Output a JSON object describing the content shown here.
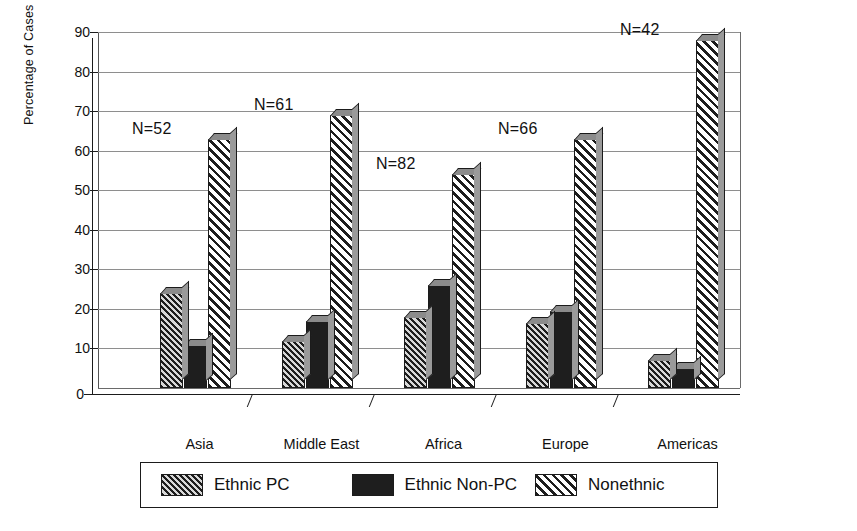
{
  "chart_data": {
    "type": "bar",
    "title": "",
    "xlabel": "",
    "ylabel": "Percentage of Cases",
    "ylim": [
      0,
      90
    ],
    "yticks": [
      0,
      10,
      20,
      30,
      40,
      50,
      60,
      70,
      80,
      90
    ],
    "grid": true,
    "legend_position": "bottom",
    "categories": [
      "Asia",
      "Middle East",
      "Africa",
      "Europe",
      "Americas"
    ],
    "series": [
      {
        "name": "Ethnic PC",
        "values": [
          24,
          12,
          18,
          16.5,
          7
        ]
      },
      {
        "name": "Ethnic Non-PC",
        "values": [
          11,
          17,
          26,
          19.5,
          5
        ]
      },
      {
        "name": "Nonethnic",
        "values": [
          63,
          69,
          54,
          63,
          88
        ]
      }
    ],
    "annotations": [
      {
        "category": "Asia",
        "text": "N=52"
      },
      {
        "category": "Middle East",
        "text": "N=61"
      },
      {
        "category": "Africa",
        "text": "N=82"
      },
      {
        "category": "Europe",
        "text": "N=66"
      },
      {
        "category": "Americas",
        "text": "N=42"
      }
    ],
    "colors": {
      "ethnic_pc": "#585858",
      "ethnic_non_pc": "#1e1e1e",
      "nonethnic": "#6d6d6d",
      "axis": "#1b1b1b",
      "grid": "#8e8e8e",
      "background": "#ffffff"
    }
  },
  "axis": {
    "y_title": "Percentage of Cases",
    "tick_labels": [
      "90",
      "80",
      "70",
      "60",
      "50",
      "40",
      "30",
      "20",
      "10",
      "0"
    ],
    "category_labels": [
      "Asia",
      "Middle East",
      "Africa",
      "Europe",
      "Americas"
    ]
  },
  "annotations": {
    "asia": "N=52",
    "middle_east": "N=61",
    "africa": "N=82",
    "europe": "N=66",
    "americas": "N=42"
  },
  "legend": {
    "items": [
      {
        "label": "Ethnic PC",
        "pattern": "diagonal-hatch-dark"
      },
      {
        "label": "Ethnic Non-PC",
        "pattern": "solid-black"
      },
      {
        "label": "Nonethnic",
        "pattern": "diagonal-hatch-light"
      }
    ]
  }
}
